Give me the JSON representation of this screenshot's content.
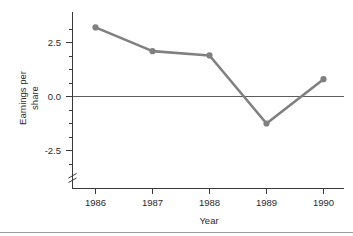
{
  "chart_data": {
    "type": "line",
    "title": "",
    "xlabel": "Year",
    "ylabel": "Earnings per share",
    "ylabel_line1": "Earnings per",
    "ylabel_line2": "share",
    "categories": [
      "1986",
      "1987",
      "1988",
      "1989",
      "1990"
    ],
    "x": [
      1986,
      1987,
      1988,
      1989,
      1990
    ],
    "values": [
      3.2,
      2.1,
      1.9,
      -1.25,
      0.8
    ],
    "series": [
      {
        "name": "Earnings per share",
        "values": [
          3.2,
          2.1,
          1.9,
          -1.25,
          0.8
        ],
        "color": "#808080",
        "marker": "circle"
      }
    ],
    "ytick_labels": [
      "2.5",
      "0.0",
      "-2.5"
    ],
    "ytick_values": [
      2.5,
      0.0,
      -2.5
    ],
    "xtick_labels": [
      "1986",
      "1987",
      "1988",
      "1989",
      "1990"
    ],
    "ylim": [
      -3.6,
      3.7
    ],
    "xlim": [
      1985.6,
      1990.4
    ],
    "grid": "off",
    "legend": "none",
    "zero_reference_line": true,
    "y_axis_break": true,
    "minor_ticks": "y-axis at 0.625 intervals",
    "line_color": "#808080",
    "axis_color": "#3a3a3a",
    "zero_line_color": "#5d5d5d",
    "background_color": "#ffffff"
  }
}
